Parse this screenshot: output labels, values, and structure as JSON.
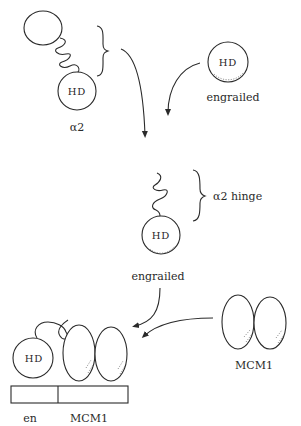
{
  "diagram": {
    "top_left": {
      "protein_label": "α2",
      "domain_label": "HD"
    },
    "top_right": {
      "protein_label": "engrailed",
      "domain_label": "HD"
    },
    "middle": {
      "hinge_label": "α2 hinge",
      "protein_label": "engrailed",
      "domain_label": "HD"
    },
    "right": {
      "protein_label": "MCM1"
    },
    "bottom_complex": {
      "domain_label": "HD",
      "site_labels": [
        "en",
        "MCM1"
      ]
    }
  }
}
